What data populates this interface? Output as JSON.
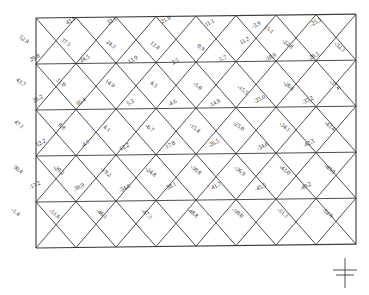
{
  "figure": {
    "kind": "truss-force-diagram",
    "support_symbol": "ground-symbol",
    "line_color": "#3a3a3a",
    "label_color": "#2a2a2a",
    "frame": {
      "x": 36,
      "y": 18,
      "width": 320,
      "height": 230,
      "rows": 5,
      "bays": 8
    }
  },
  "chart_data": {
    "type": "diagram",
    "title": "",
    "xlabel": "",
    "ylabel": "",
    "units": "kN",
    "series": [
      {
        "name": "row-1-upper-diagonals",
        "values": [
          43.9,
          33.1,
          21.8,
          11.1,
          -3.9,
          -25.3
        ]
      },
      {
        "name": "row-1-lower-diagonals",
        "values": [
          52.9,
          37.5,
          24.3,
          13.8,
          0.9,
          15.1,
          -22.8,
          -32.3
        ]
      },
      {
        "name": "row-2-upper-diagonals",
        "values": [
          29.8,
          24.5,
          13.9,
          2.5,
          -5.7,
          -11.2,
          -18.9,
          -29.5
        ]
      },
      {
        "name": "row-2-lower-diagonals",
        "values": [
          43.7,
          31.0,
          14.9,
          4.5,
          -5.0,
          -15.5,
          -26.6,
          -37.4
        ]
      },
      {
        "name": "row-3-upper-diagonals",
        "values": [
          26.2,
          16.4,
          5.3,
          -4.6,
          -14.9,
          -25.0,
          -35.2
        ]
      },
      {
        "name": "row-3-lower-diagonals",
        "values": [
          47.1,
          8.8,
          4.1,
          -6.7,
          -15.4,
          -25.0,
          -34.1,
          -43.4
        ]
      },
      {
        "name": "row-4-upper-diagonals",
        "values": [
          12.2,
          -4.7,
          -12.2,
          -17.8,
          -26.5,
          -34.6,
          -42.3
        ]
      },
      {
        "name": "row-4-lower-diagonals",
        "values": [
          30.4,
          -20.2,
          -19.2,
          -24.8,
          -30.8,
          -36.9,
          -43.0,
          -49.0
        ]
      },
      {
        "name": "row-5-upper-diagonals",
        "values": [
          -17.2,
          -30.9,
          -34.0,
          -38.1,
          -41.7,
          -45.5,
          -49.2
        ]
      },
      {
        "name": "row-5-lower-diagonals",
        "values": [
          -1.4,
          -51.6,
          -46.1,
          -47.3,
          -48.8,
          -50.0,
          -51.3,
          -52.6
        ]
      }
    ]
  },
  "labels": [
    {
      "t": "43.9",
      "x": 66,
      "y": 20,
      "r": -28
    },
    {
      "t": "33.1",
      "x": 107,
      "y": 20,
      "r": -28
    },
    {
      "t": "21.8",
      "x": 161,
      "y": 19,
      "r": -28
    },
    {
      "t": "11.1",
      "x": 205,
      "y": 22,
      "r": -28
    },
    {
      "t": "-3.9",
      "x": 252,
      "y": 24,
      "r": -28
    },
    {
      "t": "-25.3",
      "x": 310,
      "y": 22,
      "r": -28
    },
    {
      "t": "52.9",
      "x": 20,
      "y": 33,
      "r": 38
    },
    {
      "t": "37.5",
      "x": 62,
      "y": 36,
      "r": 38
    },
    {
      "t": "24.3",
      "x": 107,
      "y": 38,
      "r": 38
    },
    {
      "t": "13.8",
      "x": 151,
      "y": 39,
      "r": 38
    },
    {
      "t": "0.9",
      "x": 198,
      "y": 42,
      "r": 38
    },
    {
      "t": "15.1",
      "x": 265,
      "y": 23,
      "r": 38
    },
    {
      "t": "-22.8",
      "x": 283,
      "y": 37,
      "r": 38
    },
    {
      "t": "-32.3",
      "x": 335,
      "y": 40,
      "r": 38
    },
    {
      "t": "11.2",
      "x": 240,
      "y": 40,
      "r": -30
    },
    {
      "t": "29.8",
      "x": 30,
      "y": 57,
      "r": -28
    },
    {
      "t": "24.5",
      "x": 80,
      "y": 58,
      "r": -28
    },
    {
      "t": "13.9",
      "x": 128,
      "y": 59,
      "r": -28
    },
    {
      "t": "2.5",
      "x": 172,
      "y": 60,
      "r": -28
    },
    {
      "t": "-5.7",
      "x": 218,
      "y": 58,
      "r": -28
    },
    {
      "t": "-18.9",
      "x": 265,
      "y": 57,
      "r": -28
    },
    {
      "t": "-29.5",
      "x": 308,
      "y": 56,
      "r": -28
    },
    {
      "t": "43.7",
      "x": 17,
      "y": 76,
      "r": 38
    },
    {
      "t": "31.0",
      "x": 57,
      "y": 76,
      "r": 38
    },
    {
      "t": "14.9",
      "x": 106,
      "y": 77,
      "r": 38
    },
    {
      "t": "4.5",
      "x": 151,
      "y": 79,
      "r": 38
    },
    {
      "t": "-5.0",
      "x": 194,
      "y": 80,
      "r": 38
    },
    {
      "t": "-15.5",
      "x": 238,
      "y": 83,
      "r": 38
    },
    {
      "t": "-26.6",
      "x": 284,
      "y": 79,
      "r": 38
    },
    {
      "t": "-37.4",
      "x": 330,
      "y": 78,
      "r": 38
    },
    {
      "t": "26.2",
      "x": 33,
      "y": 98,
      "r": -28
    },
    {
      "t": "16.4",
      "x": 76,
      "y": 101,
      "r": -28
    },
    {
      "t": "5.3",
      "x": 127,
      "y": 101,
      "r": -28
    },
    {
      "t": "-4.6",
      "x": 168,
      "y": 102,
      "r": -28
    },
    {
      "t": "-14.9",
      "x": 209,
      "y": 103,
      "r": -28
    },
    {
      "t": "-25.0",
      "x": 254,
      "y": 99,
      "r": -28
    },
    {
      "t": "-35.2",
      "x": 302,
      "y": 100,
      "r": -28
    },
    {
      "t": "47.1",
      "x": 15,
      "y": 118,
      "r": 38
    },
    {
      "t": "8.8",
      "x": 59,
      "y": 121,
      "r": 38
    },
    {
      "t": "4.1",
      "x": 104,
      "y": 123,
      "r": 38
    },
    {
      "t": "-6.7",
      "x": 146,
      "y": 122,
      "r": 38
    },
    {
      "t": "-15.4",
      "x": 190,
      "y": 121,
      "r": 38
    },
    {
      "t": "-25.0",
      "x": 234,
      "y": 119,
      "r": 38
    },
    {
      "t": "-34.1",
      "x": 280,
      "y": 120,
      "r": 38
    },
    {
      "t": "-43.4",
      "x": 325,
      "y": 119,
      "r": 38
    },
    {
      "t": "12.2",
      "x": 36,
      "y": 142,
      "r": -28
    },
    {
      "t": "-4.7",
      "x": 81,
      "y": 143,
      "r": -28
    },
    {
      "t": "-12.2",
      "x": 118,
      "y": 147,
      "r": -28
    },
    {
      "t": "-17.8",
      "x": 164,
      "y": 145,
      "r": -28
    },
    {
      "t": "-26.5",
      "x": 208,
      "y": 143,
      "r": -28
    },
    {
      "t": "-34.6",
      "x": 257,
      "y": 146,
      "r": -28
    },
    {
      "t": "-42.3",
      "x": 303,
      "y": 143,
      "r": -28
    },
    {
      "t": "30.4",
      "x": 14,
      "y": 163,
      "r": 38
    },
    {
      "t": "-20.2",
      "x": 54,
      "y": 163,
      "r": 38
    },
    {
      "t": "-19.2",
      "x": 101,
      "y": 165,
      "r": 38
    },
    {
      "t": "-24.8",
      "x": 146,
      "y": 165,
      "r": 38
    },
    {
      "t": "-30.8",
      "x": 191,
      "y": 163,
      "r": 38
    },
    {
      "t": "-36.9",
      "x": 235,
      "y": 164,
      "r": 38
    },
    {
      "t": "-43.0",
      "x": 280,
      "y": 163,
      "r": 38
    },
    {
      "t": "-49.0",
      "x": 325,
      "y": 162,
      "r": 38
    },
    {
      "t": "-17.2",
      "x": 29,
      "y": 185,
      "r": -28
    },
    {
      "t": "-30.9",
      "x": 73,
      "y": 187,
      "r": -28
    },
    {
      "t": "-34.0",
      "x": 119,
      "y": 188,
      "r": -28
    },
    {
      "t": "-38.1",
      "x": 165,
      "y": 186,
      "r": -28
    },
    {
      "t": "-41.7",
      "x": 210,
      "y": 186,
      "r": -28
    },
    {
      "t": "-45.5",
      "x": 255,
      "y": 187,
      "r": -28
    },
    {
      "t": "-49.2",
      "x": 300,
      "y": 186,
      "r": -28
    },
    {
      "t": "-1.4",
      "x": 12,
      "y": 206,
      "r": 38
    },
    {
      "t": "-51.6",
      "x": 50,
      "y": 207,
      "r": 38
    },
    {
      "t": "-46.1",
      "x": 97,
      "y": 207,
      "r": 38
    },
    {
      "t": "-47.3",
      "x": 142,
      "y": 207,
      "r": 38
    },
    {
      "t": "-48.8",
      "x": 188,
      "y": 206,
      "r": 38
    },
    {
      "t": "-50.0",
      "x": 233,
      "y": 206,
      "r": 38
    },
    {
      "t": "-51.3",
      "x": 278,
      "y": 206,
      "r": 38
    },
    {
      "t": "-52.6",
      "x": 323,
      "y": 206,
      "r": 38
    }
  ]
}
